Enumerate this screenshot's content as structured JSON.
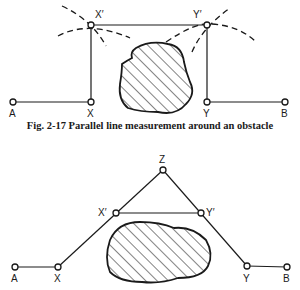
{
  "figures": [
    {
      "id": "fig-2-17",
      "caption": "Fig. 2-17  Parallel line measurement around an obstacle",
      "points": {
        "A": {
          "label": "A",
          "x": 13,
          "y": 102
        },
        "X": {
          "label": "X",
          "x": 91,
          "y": 102
        },
        "X_prime": {
          "label": "X′",
          "x": 91,
          "y": 25
        },
        "Y_prime": {
          "label": "Y′",
          "x": 207,
          "y": 25
        },
        "Y": {
          "label": "Y",
          "x": 207,
          "y": 102
        },
        "B": {
          "label": "B",
          "x": 285,
          "y": 102
        }
      },
      "obstacle": "hatched irregular blob between X and Y",
      "construction_arcs": "dashed arcs intersecting at X′ and Y′"
    },
    {
      "id": "fig-2-18",
      "caption": "",
      "points": {
        "Z": {
          "label": "Z",
          "x": 163,
          "y": 170
        },
        "X_prime": {
          "label": "X′",
          "x": 116,
          "y": 213
        },
        "Y_prime": {
          "label": "Y′",
          "x": 201,
          "y": 213
        },
        "A": {
          "label": "A",
          "x": 15,
          "y": 267
        },
        "X": {
          "label": "X",
          "x": 58,
          "y": 267
        },
        "Y": {
          "label": "Y",
          "x": 247,
          "y": 266
        },
        "B": {
          "label": "B",
          "x": 287,
          "y": 267
        }
      },
      "obstacle": "hatched irregular blob below X′Y′"
    }
  ],
  "colors": {
    "ink": "#1a1a1a",
    "background": "#ffffff"
  }
}
